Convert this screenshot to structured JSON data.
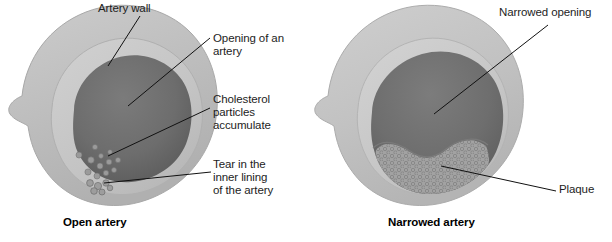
{
  "figure": {
    "type": "anatomical-diagram"
  },
  "colors": {
    "background": "#ffffff",
    "outer_wall_light": "#c6c6c6",
    "outer_wall_mid": "#b3b3b3",
    "media_ring": "#c9c9c9",
    "media_ring_dark": "#bdbdbd",
    "lumen_dark": "#6f6f6f",
    "lumen_shadow": "#5f5f5f",
    "plaque_fill": "#9a9a9a",
    "plaque_speckle": "#7e7e7e",
    "particle": "#8c8c8c",
    "leader_line": "#111111",
    "text": "#1d1d1d"
  },
  "panels": [
    {
      "id": "open-artery",
      "caption": "Open artery",
      "labels": [
        {
          "id": "artery-wall",
          "text": "Artery wall"
        },
        {
          "id": "opening-of-an-artery",
          "text": "Opening of an\nartery"
        },
        {
          "id": "cholesterol-particles",
          "text": "Cholesterol\nparticles\naccumulate"
        },
        {
          "id": "tear-inner-lining",
          "text": "Tear in the\ninner lining\nof the artery"
        }
      ]
    },
    {
      "id": "narrowed-artery",
      "caption": "Narrowed artery",
      "labels": [
        {
          "id": "narrowed-opening",
          "text": "Narrowed opening"
        },
        {
          "id": "plaque",
          "text": "Plaque"
        }
      ]
    }
  ]
}
